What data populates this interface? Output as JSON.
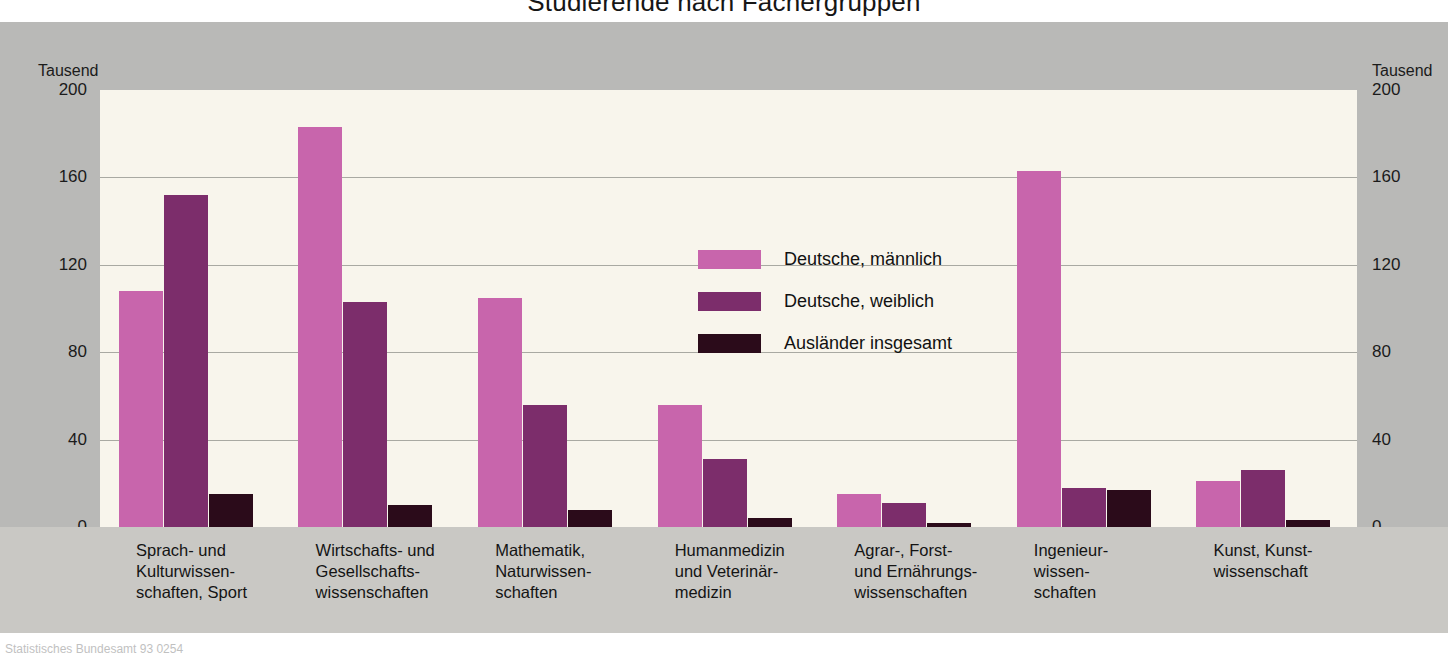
{
  "title": "Studierende nach Fächergruppen",
  "axis": {
    "unit_left": "Tausend",
    "unit_right": "Tausend",
    "ticks": [
      "200",
      "160",
      "120",
      "80",
      "40",
      "0"
    ]
  },
  "legend": {
    "items": [
      {
        "label": "Deutsche, männlich",
        "color": "#c865ac"
      },
      {
        "label": "Deutsche, weiblich",
        "color": "#7c2d6b"
      },
      {
        "label": "Ausländer insgesamt",
        "color": "#2b0b1a"
      }
    ]
  },
  "footer": "Statistisches Bundesamt 93 0254",
  "chart_data": {
    "type": "bar",
    "title": "Studierende nach Fächergruppen",
    "xlabel": "",
    "ylabel": "Tausend",
    "ylim": [
      0,
      200
    ],
    "yticks": [
      0,
      40,
      80,
      120,
      160,
      200
    ],
    "grid": true,
    "legend_position": "inside-top-center",
    "categories": [
      "Sprach- und\nKulturwissen-\nschaften, Sport",
      "Wirtschafts- und\nGesellschafts-\nwissenschaften",
      "Mathematik,\nNaturwissen-\nschaften",
      "Humanmedizin\nund Veterinär-\nmedizin",
      "Agrar-, Forst-\nund Ernährungs-\nwissenschaften",
      "Ingenieur-\nwissen-\nschaften",
      "Kunst, Kunst-\nwissenschaft"
    ],
    "series": [
      {
        "name": "Deutsche, männlich",
        "color": "#c865ac",
        "values": [
          108,
          183,
          105,
          56,
          15,
          163,
          21
        ]
      },
      {
        "name": "Deutsche, weiblich",
        "color": "#7c2d6b",
        "values": [
          152,
          103,
          56,
          31,
          11,
          18,
          26
        ]
      },
      {
        "name": "Ausländer insgesamt",
        "color": "#2b0b1a",
        "values": [
          15,
          10,
          8,
          4,
          2,
          17,
          3
        ]
      }
    ]
  }
}
